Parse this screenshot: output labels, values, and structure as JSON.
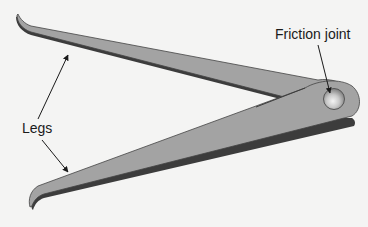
{
  "diagram": {
    "labels": {
      "friction_joint": "Friction joint",
      "legs": "Legs"
    },
    "colors": {
      "background": "#f4f4f3",
      "leg_fill": "#a3a3a3",
      "leg_edge": "#3c3c3c",
      "joint_highlight": "#f0f0f0",
      "text": "#1a1a1a"
    },
    "parts": [
      {
        "name": "upper-leg"
      },
      {
        "name": "lower-leg"
      },
      {
        "name": "friction-joint"
      }
    ]
  }
}
